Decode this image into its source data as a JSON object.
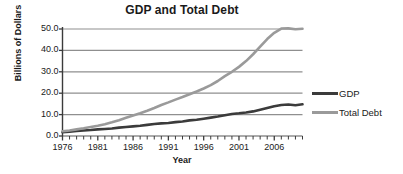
{
  "chart_data": {
    "type": "line",
    "title": "GDP and Total Debt",
    "xlabel": "Year",
    "ylabel": "Billions of Dollars",
    "xlim": [
      1976,
      2010
    ],
    "ylim": [
      0,
      50
    ],
    "grid": true,
    "legend_position": "right",
    "y_ticks": [
      "0.0",
      "10.0",
      "20.0",
      "30.0",
      "40.0",
      "50.0"
    ],
    "y_tick_values": [
      0,
      10,
      20,
      30,
      40,
      50
    ],
    "x_ticks": [
      "1976",
      "1981",
      "1986",
      "1991",
      "1996",
      "2001",
      "2006"
    ],
    "x_tick_values": [
      1976,
      1981,
      1986,
      1991,
      1996,
      2001,
      2006
    ],
    "x_minor_tick_interval": 1,
    "x": [
      1976,
      1977,
      1978,
      1979,
      1980,
      1981,
      1982,
      1983,
      1984,
      1985,
      1986,
      1987,
      1988,
      1989,
      1990,
      1991,
      1992,
      1993,
      1994,
      1995,
      1996,
      1997,
      1998,
      1999,
      2000,
      2001,
      2002,
      2003,
      2004,
      2005,
      2006,
      2007,
      2008,
      2009,
      2010
    ],
    "series": [
      {
        "name": "GDP",
        "color": "#3b3b3b",
        "values": [
          1.8,
          2.0,
          2.3,
          2.6,
          2.8,
          3.1,
          3.3,
          3.5,
          3.9,
          4.2,
          4.5,
          4.8,
          5.2,
          5.6,
          5.9,
          6.1,
          6.5,
          6.8,
          7.3,
          7.6,
          8.1,
          8.6,
          9.1,
          9.7,
          10.3,
          10.6,
          11.0,
          11.5,
          12.3,
          13.1,
          13.9,
          14.5,
          14.7,
          14.4,
          14.8
        ]
      },
      {
        "name": "Total Debt",
        "color": "#9a9a9a",
        "values": [
          2.2,
          2.6,
          3.1,
          3.6,
          4.2,
          4.8,
          5.5,
          6.4,
          7.4,
          8.5,
          9.6,
          10.6,
          11.8,
          13.1,
          14.5,
          15.7,
          17.0,
          18.2,
          19.5,
          20.8,
          22.2,
          23.8,
          25.7,
          28.0,
          30.0,
          32.3,
          35.0,
          38.2,
          41.8,
          45.3,
          48.2,
          50.2,
          50.3,
          49.9,
          50.1
        ]
      }
    ]
  },
  "legend": {
    "items": [
      {
        "label": "GDP",
        "color": "#3b3b3b"
      },
      {
        "label": "Total Debt",
        "color": "#9a9a9a"
      }
    ]
  },
  "axes": {
    "grid_color": "#8f8f8f",
    "axis_color": "#3b3b3b"
  }
}
